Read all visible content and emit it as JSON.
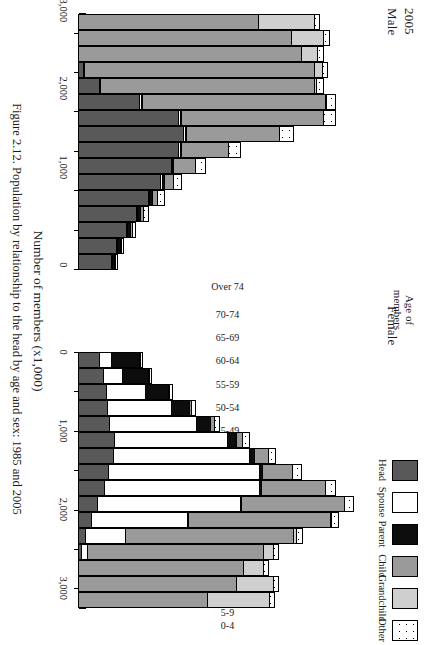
{
  "figure": {
    "year": "2005",
    "male_label": "Male",
    "female_label": "Female",
    "age_axis_label": "Age of\nmembers",
    "value_axis_label": "Number of members (x1,000)",
    "caption": "Figure 2.12. Population by relationship to the head by age and sex: 1985 and 2005"
  },
  "legend": {
    "items": [
      {
        "label": "Head",
        "color": "#595959",
        "pattern": "solid"
      },
      {
        "label": "Spouse",
        "color": "#ffffff",
        "pattern": "solid"
      },
      {
        "label": "Parent",
        "color": "#0d0d0d",
        "pattern": "solid"
      },
      {
        "label": "Child",
        "color": "#9a9a9a",
        "pattern": "solid"
      },
      {
        "label": "Grandchild",
        "color": "#cfcfcf",
        "pattern": "solid"
      },
      {
        "label": "Other",
        "color": "#ffffff",
        "pattern": "dotted"
      }
    ]
  },
  "axis": {
    "ticks_major": [
      "0",
      "1,000",
      "2,000",
      "3,000"
    ],
    "tick_values": [
      0,
      500,
      1000,
      1500,
      2000,
      2500,
      3000
    ],
    "max": 3250,
    "unit": "x1,000"
  },
  "chart_data": {
    "type": "bar",
    "subtype": "back-to-back stacked population pyramid",
    "title": "Figure 2.12. Population by relationship to the head by age and sex: 1985 and 2005",
    "xlabel": "Number of members (x1,000)",
    "ylabel": "Age of members",
    "xlim": [
      0,
      3250
    ],
    "grid": false,
    "legend_position": "top-right",
    "categories": [
      "Over 74",
      "70-74",
      "65-69",
      "60-64",
      "55-59",
      "50-54",
      "45-49",
      "40-44",
      "35-39",
      "30-34",
      "25-29",
      "20-24",
      "15-19",
      "10-14",
      "5-9",
      "0-4"
    ],
    "series_names": [
      "Head",
      "Spouse",
      "Parent",
      "Child",
      "Grandchild",
      "Other"
    ],
    "panels": [
      {
        "name": "Male",
        "direction": "left",
        "series": [
          {
            "name": "Head",
            "values": [
              370,
              430,
              530,
              640,
              770,
              900,
              1010,
              1090,
              1140,
              1080,
              660,
              215,
              40,
              0,
              0,
              0
            ]
          },
          {
            "name": "Spouse",
            "values": [
              5,
              6,
              8,
              10,
              12,
              14,
              16,
              18,
              20,
              22,
              18,
              8,
              2,
              0,
              0,
              0
            ]
          },
          {
            "name": "Parent",
            "values": [
              30,
              28,
              36,
              32,
              26,
              20,
              14,
              10,
              6,
              4,
              2,
              0,
              0,
              0,
              0,
              0
            ]
          },
          {
            "name": "Child",
            "values": [
              8,
              10,
              18,
              30,
              60,
              110,
              240,
              520,
              1020,
              1560,
              2010,
              2340,
              2520,
              2420,
              2320,
              1960
            ]
          },
          {
            "name": "Grandchild",
            "values": [
              0,
              0,
              0,
              0,
              0,
              0,
              0,
              0,
              0,
              0,
              4,
              25,
              90,
              185,
              350,
              610
            ]
          },
          {
            "name": "Other",
            "values": [
              20,
              26,
              40,
              55,
              70,
              85,
              110,
              130,
              150,
              130,
              96,
              72,
              60,
              60,
              60,
              55
            ]
          }
        ],
        "totals": [
          433,
          500,
          632,
          767,
          938,
          1129,
          1390,
          1768,
          2336,
          2796,
          2790,
          2660,
          2712,
          2665,
          2730,
          2625
        ]
      },
      {
        "name": "Female",
        "direction": "right",
        "series": [
          {
            "name": "Head",
            "values": [
              230,
              270,
              300,
              310,
              330,
              380,
              370,
              320,
              270,
              195,
              130,
              70,
              22,
              0,
              0,
              0
            ]
          },
          {
            "name": "Spouse",
            "values": [
              130,
              215,
              430,
              700,
              960,
              1240,
              1490,
              1650,
              1700,
              1560,
              1060,
              430,
              70,
              0,
              0,
              0
            ]
          },
          {
            "name": "Parent",
            "values": [
              320,
              285,
              255,
              200,
              150,
              100,
              55,
              28,
              14,
              6,
              2,
              0,
              0,
              0,
              0,
              0
            ]
          },
          {
            "name": "Child",
            "values": [
              6,
              8,
              12,
              20,
              40,
              70,
              150,
              330,
              700,
              1130,
              1550,
              1840,
              1920,
              1800,
              1720,
              1400
            ]
          },
          {
            "name": "Grandchild",
            "values": [
              0,
              0,
              0,
              0,
              0,
              0,
              0,
              0,
              0,
              0,
              6,
              30,
              110,
              210,
              400,
              680
            ]
          },
          {
            "name": "Other",
            "values": [
              22,
              25,
              35,
              45,
              58,
              70,
              85,
              100,
              110,
              100,
              80,
              68,
              60,
              60,
              60,
              55
            ]
          }
        ],
        "totals": [
          708,
          803,
          1032,
          1275,
          1538,
          1860,
          2150,
          2428,
          2794,
          2991,
          2828,
          2438,
          2182,
          2070,
          2180,
          2135
        ]
      }
    ]
  }
}
